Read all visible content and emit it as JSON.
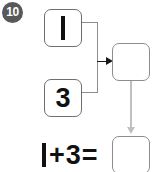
{
  "worksheet": {
    "problem_number": "10",
    "type": "part-part-whole addition",
    "colors": {
      "badge_background": "#58585a",
      "badge_text": "#ffffff",
      "box_border": "#8d8d8d",
      "sum_box_border": "#8d8d8d",
      "arrow_black": "#1a1a1a",
      "arrow_gray": "#c0c0c0",
      "text": "#111111",
      "page_background": "#ffffff"
    }
  },
  "diagram": {
    "addend_top": {
      "value": "1",
      "glyph_style": "vertical-bar"
    },
    "addend_bottom": {
      "value": "3",
      "glyph_style": "numeral"
    },
    "sum_box": {
      "value": "",
      "placeholder": ""
    },
    "connector": {
      "style": "bracket-with-arrow",
      "arrow_direction": "right"
    },
    "transfer_arrow": {
      "direction": "down",
      "color": "#c0c0c0"
    }
  },
  "equation": {
    "first_term": "1",
    "first_term_glyph": "vertical-bar",
    "operator": "+",
    "second_term": "3",
    "equals": "=",
    "answer_box": {
      "value": "",
      "placeholder": ""
    }
  }
}
